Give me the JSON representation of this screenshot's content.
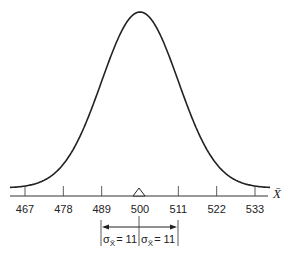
{
  "chart_data": {
    "type": "line",
    "title": "",
    "xlabel": "X̄",
    "ylabel": "",
    "distribution": "normal",
    "mean": 500,
    "std_error": 11,
    "x_ticks": [
      467,
      478,
      489,
      500,
      511,
      522,
      533
    ],
    "xlim": [
      464,
      536
    ],
    "grid": false,
    "annotations": [
      {
        "type": "mean-marker",
        "x": 500,
        "shape": "triangle"
      },
      {
        "type": "interval-arrow",
        "from": 489,
        "to": 500,
        "label": "σX̄ = 11"
      },
      {
        "type": "interval-arrow",
        "from": 500,
        "to": 511,
        "label": "σX̄ = 11"
      }
    ]
  },
  "axis": {
    "label": "X̄",
    "ticks": [
      "467",
      "478",
      "489",
      "500",
      "511",
      "522",
      "533"
    ]
  },
  "annotation": {
    "left_sigma": "σ",
    "left_sub": "X̄",
    "left_value": "= 11",
    "right_sigma": "σ",
    "right_sub": "X̄",
    "right_value": "= 11"
  }
}
